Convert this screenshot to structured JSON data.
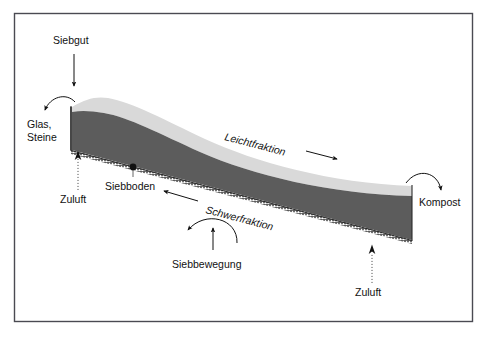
{
  "diagram": {
    "background_color": "#ffffff",
    "frame_color": "#4a4a52",
    "labels": {
      "feed": "Siebgut",
      "glass_stones": "Glas,",
      "glass_stones_line2": "Steine",
      "air_inlet_left": "Zuluft",
      "air_inlet_right": "Zuluft",
      "screen_deck": "Siebboden",
      "light_fraction": "Leichtfraktion",
      "heavy_fraction": "Schwerfraktion",
      "screen_motion": "Siebbewegung",
      "compost": "Kompost"
    },
    "colors": {
      "light_layer": "#d9d9d9",
      "dark_layer": "#5c5c5c",
      "end_face": "#6a6a6a",
      "text": "#111111",
      "arrow": "#111111",
      "dotted_arrow": "#555555"
    },
    "flows": [
      {
        "name": "Siebgut",
        "direction": "down",
        "style": "solid-arrow"
      },
      {
        "name": "Glas, Steine",
        "direction": "left-down",
        "style": "curved-arrow"
      },
      {
        "name": "Zuluft",
        "direction": "up",
        "style": "dotted-arrow"
      },
      {
        "name": "Leichtfraktion",
        "direction": "right-down",
        "style": "solid-arrow"
      },
      {
        "name": "Schwerfraktion",
        "direction": "left-up",
        "style": "solid-arrow"
      },
      {
        "name": "Siebbewegung",
        "direction": "oscillating",
        "style": "arc-and-arrow"
      },
      {
        "name": "Kompost",
        "direction": "right-down",
        "style": "curved-arrow"
      },
      {
        "name": "Zuluft",
        "direction": "up",
        "style": "dotted-arrow"
      }
    ]
  }
}
